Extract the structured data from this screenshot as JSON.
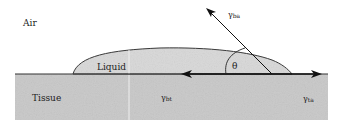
{
  "diagram": {
    "type": "contact-angle-schematic",
    "regions": {
      "air": "Air",
      "liquid": "Liquid",
      "tissue": "Tissue"
    },
    "forces": {
      "liquid_air": {
        "symbol": "γ",
        "sub": "ba"
      },
      "tissue_liquid": {
        "symbol": "γ",
        "sub": "bt"
      },
      "tissue_air": {
        "symbol": "γ",
        "sub": "ta"
      }
    },
    "angle": "θ",
    "colors": {
      "tissue": "#c9c9c9",
      "liquid": "#d9d9d9",
      "lines": "#222222",
      "background": "#ffffff"
    }
  }
}
